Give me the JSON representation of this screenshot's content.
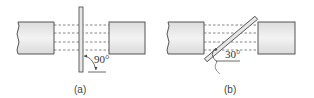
{
  "panels": [
    {
      "id": "a",
      "caption": "(a)",
      "angle_label": "90°",
      "angle_deg": 90
    },
    {
      "id": "b",
      "caption": "(b)",
      "angle_label": "30°",
      "angle_deg": 30
    }
  ],
  "colors": {
    "block_fill": "#ececec",
    "block_stroke": "#555555",
    "plate_fill": "#e6e6e6",
    "dashed": "#666666"
  }
}
